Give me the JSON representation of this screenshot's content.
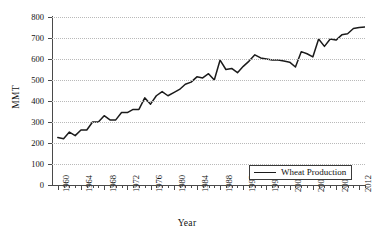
{
  "chart_data": {
    "type": "line",
    "title": "",
    "xlabel": "Year",
    "ylabel": "MMT",
    "xlim": [
      1959,
      2013
    ],
    "ylim": [
      0,
      800
    ],
    "grid": true,
    "legend_position": "bottom-right",
    "legend_entries": [
      "Wheat Production"
    ],
    "ytick_labels": [
      "0",
      "100",
      "200",
      "300",
      "400",
      "500",
      "600",
      "700",
      "800"
    ],
    "ytick_values": [
      0,
      100,
      200,
      300,
      400,
      500,
      600,
      700,
      800
    ],
    "xtick_labels": [
      "1960",
      "1964",
      "1968",
      "1972",
      "1976",
      "1980",
      "1984",
      "1988",
      "1992",
      "1996",
      "2000",
      "2004",
      "2008",
      "2012"
    ],
    "xtick_values": [
      1960,
      1964,
      1968,
      1972,
      1976,
      1980,
      1984,
      1988,
      1992,
      1996,
      2000,
      2004,
      2008,
      2012
    ],
    "series": [
      {
        "name": "Wheat Production",
        "color": "#1b1b1b",
        "x": [
          1960,
          1961,
          1962,
          1963,
          1964,
          1965,
          1966,
          1967,
          1968,
          1969,
          1970,
          1971,
          1972,
          1973,
          1974,
          1975,
          1976,
          1977,
          1978,
          1979,
          1980,
          1981,
          1982,
          1983,
          1984,
          1985,
          1986,
          1987,
          1988,
          1989,
          1990,
          1991,
          1992,
          1993,
          1994,
          1995,
          1996,
          1997,
          1998,
          1999,
          2000,
          2001,
          2002,
          2003,
          2004,
          2005,
          2006,
          2007,
          2008,
          2009,
          2010,
          2011,
          2012,
          2013
        ],
        "values": [
          226,
          220,
          252,
          235,
          262,
          262,
          300,
          300,
          330,
          310,
          310,
          345,
          345,
          360,
          360,
          415,
          385,
          425,
          445,
          425,
          440,
          455,
          480,
          490,
          515,
          510,
          530,
          500,
          595,
          550,
          555,
          535,
          565,
          590,
          620,
          605,
          600,
          595,
          595,
          590,
          585,
          562,
          635,
          625,
          610,
          695,
          660,
          695,
          690,
          715,
          720,
          745,
          750,
          752
        ]
      }
    ]
  },
  "axes": {
    "y_title": "MMT",
    "x_title": "Year"
  },
  "legend": {
    "label": "Wheat Production"
  }
}
